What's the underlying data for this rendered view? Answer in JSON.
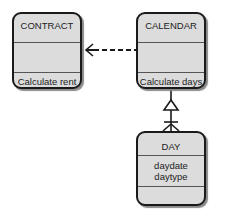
{
  "diagram": {
    "classes": [
      {
        "id": "contract",
        "name": "CONTRACT",
        "attributes": [],
        "operations": [
          "Calculate rent"
        ]
      },
      {
        "id": "calendar",
        "name": "CALENDAR",
        "attributes": [],
        "operations": [
          "Calculate days"
        ]
      },
      {
        "id": "day",
        "name": "DAY",
        "attributes": [
          "daydate",
          "daytype"
        ],
        "operations": []
      }
    ],
    "relationships": [
      {
        "from": "contract",
        "to": "calendar",
        "type": "dependency",
        "style": "dashed",
        "arrow_at": "contract"
      },
      {
        "from": "calendar",
        "to": "day",
        "type": "aggregation-one-to-many",
        "calendar_end": "hollow-triangle",
        "day_end": "crows-foot-with-bar"
      }
    ]
  }
}
